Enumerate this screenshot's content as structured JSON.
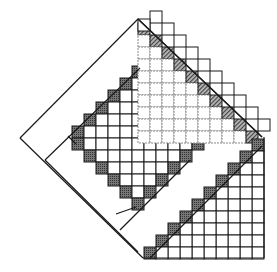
{
  "figure": {
    "title": "",
    "colors": {
      "stroke": "#1a1a1a",
      "dark_cell": "#555555",
      "hatched_cell": "#8a8a8a",
      "dashed_grid": "#888888",
      "background": "#ffffff"
    },
    "cell_size": 12,
    "top_triangle_rows": 10,
    "bottom_triangle_rows": 10,
    "middle_grid_dark_cells": 14
  }
}
